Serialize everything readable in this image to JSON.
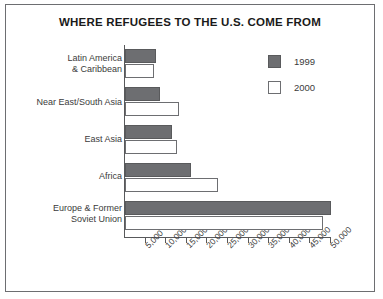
{
  "chart_data": {
    "type": "bar",
    "orientation": "horizontal",
    "title": "WHERE REFUGEES TO THE U.S. COME FROM",
    "xlabel": "",
    "ylabel": "",
    "categories": [
      "Latin America\n& Caribbean",
      "Near East/South Asia",
      "East Asia",
      "Africa",
      "Europe & Former\nSoviet Union"
    ],
    "series": [
      {
        "name": "1999",
        "color": "#6d6e71",
        "values": [
          7500,
          8500,
          11500,
          16000,
          50000
        ]
      },
      {
        "name": "2000",
        "color": "#ffffff",
        "values": [
          7000,
          13000,
          12500,
          22500,
          48000
        ]
      }
    ],
    "xlim": [
      0,
      50000
    ],
    "xticks": [
      5000,
      10000,
      15000,
      20000,
      25000,
      30000,
      35000,
      40000,
      45000,
      50000
    ],
    "xticklabels": [
      "5,000",
      "10,000",
      "15,000",
      "20,000",
      "25,000",
      "30,000",
      "35,000",
      "40,000",
      "45,000",
      "50,000"
    ],
    "grid": false,
    "legend_position": "top-right"
  },
  "legend": {
    "entries": [
      {
        "label": "1999"
      },
      {
        "label": "2000"
      }
    ]
  },
  "categories": [
    {
      "line1": "Latin America",
      "line2": "& Caribbean"
    },
    {
      "line1": "Near East/South Asia",
      "line2": ""
    },
    {
      "line1": "East Asia",
      "line2": ""
    },
    {
      "line1": "Africa",
      "line2": ""
    },
    {
      "line1": "Europe & Former",
      "line2": "Soviet Union"
    }
  ]
}
